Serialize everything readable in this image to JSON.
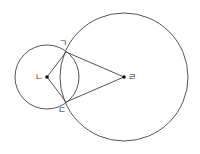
{
  "diagram": {
    "type": "two intersecting circles with kite formed by centers and intersection points",
    "stroke_color": "#555555",
    "circles": [
      {
        "name": "small-circle",
        "center_label": "ㄴ",
        "cx": 47,
        "cy": 77,
        "r": 32
      },
      {
        "name": "large-circle",
        "center_label": "ㄹ",
        "cx": 124,
        "cy": 77,
        "r": 64
      }
    ],
    "points": [
      {
        "label": "ㄱ",
        "role": "upper intersection",
        "x": 66,
        "y": 52,
        "label_x": 59,
        "label_y": 46
      },
      {
        "label": "ㄴ",
        "role": "center of small circle",
        "x": 47,
        "y": 77,
        "label_x": 35,
        "label_y": 80
      },
      {
        "label": "ㄷ",
        "role": "lower intersection",
        "x": 66,
        "y": 102,
        "label_x": 58,
        "label_y": 113
      },
      {
        "label": "ㄹ",
        "role": "center of large circle",
        "x": 124,
        "y": 77,
        "label_x": 128,
        "label_y": 80
      }
    ],
    "segments": [
      [
        "ㄴ",
        "ㄱ"
      ],
      [
        "ㄴ",
        "ㄷ"
      ],
      [
        "ㄱ",
        "ㄹ"
      ],
      [
        "ㄷ",
        "ㄹ"
      ]
    ]
  }
}
